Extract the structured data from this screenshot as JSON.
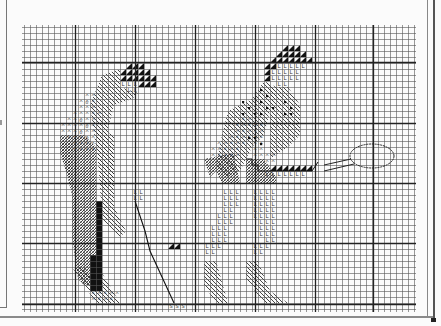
{
  "chart": {
    "grid": {
      "x0": 24,
      "y0": 27,
      "cell": 6,
      "cols": 65,
      "rows": 47,
      "major_every": 10,
      "major_x": [
        75,
        135,
        195,
        255,
        315,
        373
      ],
      "major_y": [
        62,
        123,
        183,
        243,
        304
      ],
      "line_color": "#555555",
      "major_color": "#222222"
    },
    "symbols": {
      "solid_triangle": "dark brown (hair)",
      "L": "skin tone",
      "A": "light shirt",
      "dot_square": "shirt pattern",
      "diagonal_hatch": "trousers / skirt",
      "double_hatch": "shadow",
      "solid_black": "golf bag",
      "S": "golf ball / shoe",
      "racket_outline": "tennis racket"
    },
    "figures": [
      {
        "name": "golfer",
        "label": "Golfer"
      },
      {
        "name": "tennis-player",
        "label": "Tennis player"
      }
    ]
  }
}
